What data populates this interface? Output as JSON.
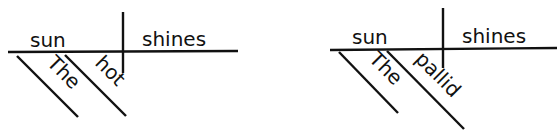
{
  "diagrams": [
    {
      "subject": "sun",
      "predicate": "shines",
      "modifiers": [
        "The",
        "hot"
      ]
    },
    {
      "subject": "sun",
      "predicate": "shines",
      "modifiers": [
        "The",
        "pallid"
      ]
    }
  ],
  "colors": {
    "ink": "#111111",
    "background": "#ffffff"
  }
}
